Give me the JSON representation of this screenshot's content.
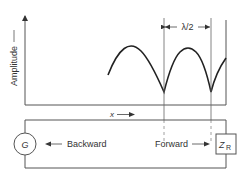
{
  "diagram": {
    "y_axis_label": "Amplitude",
    "x_axis_label": "x",
    "wavelength_label": "λ/2",
    "generator_label": "G",
    "load_label": "Z",
    "load_subscript": "R",
    "backward_label": "Backward",
    "forward_label": "Forward",
    "colors": {
      "line": "#444444",
      "curve": "#222222",
      "background": "#ffffff"
    }
  }
}
